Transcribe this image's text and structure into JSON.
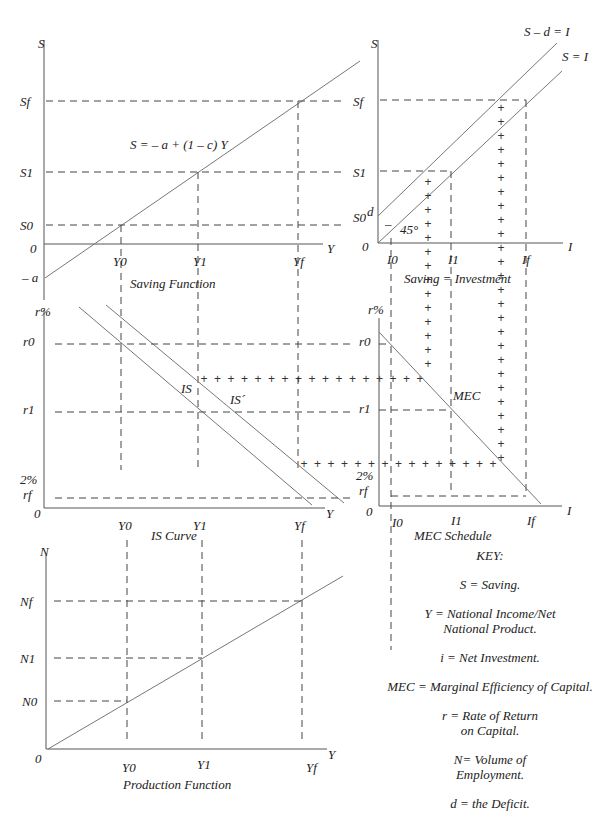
{
  "panels": {
    "saving_function": {
      "caption": "Saving Function",
      "y_axis": "S",
      "x_axis": "Y",
      "origin": "0",
      "y_ticks": [
        "Sf",
        "S1",
        "S0",
        "– a"
      ],
      "x_ticks": [
        "Y0",
        "Y1",
        "Yf"
      ],
      "equation": "S = – a + (1 – c) Y"
    },
    "saving_investment": {
      "caption": "Saving  = Investment",
      "y_axis": "S",
      "x_axis": "I",
      "origin": "0",
      "y_ticks": [
        "Sf",
        "S1",
        "S0",
        "d"
      ],
      "x_ticks": [
        "I0",
        "I1",
        "If"
      ],
      "lines": [
        "S – d = I",
        "S = I"
      ],
      "angle": "45°",
      "minus": "–"
    },
    "is_curve": {
      "caption": "IS Curve",
      "y_axis": "r%",
      "x_axis": "Y",
      "origin": "0",
      "y_ticks": [
        "r0",
        "r1",
        "2%",
        "rf"
      ],
      "x_ticks": [
        "Y0",
        "Y1",
        "Yf"
      ],
      "curves": [
        "IS",
        "IS´"
      ]
    },
    "mec_schedule": {
      "caption": "MEC Schedule",
      "y_axis": "r%",
      "x_axis": "I",
      "origin": "0",
      "y_ticks": [
        "r0",
        "r1",
        "2%",
        "rf"
      ],
      "x_ticks": [
        "I0",
        "I1",
        "If"
      ],
      "curve": "MEC"
    },
    "production_function": {
      "caption": "Production Function",
      "y_axis": "N",
      "x_axis": "Y",
      "origin": "0",
      "y_ticks": [
        "Nf",
        "N1",
        "N0"
      ],
      "x_ticks": [
        "Y0",
        "Y1",
        "Yf"
      ]
    }
  },
  "key": {
    "title": "KEY:",
    "items": [
      "S = Saving.",
      "Y = National Income/Net\nNational Product.",
      "i = Net Investment.",
      "MEC = Marginal Efficiency of Capital.",
      "r = Rate of Return\non  Capital.",
      "N= Volume of\nEmployment.",
      "d = the Deficit."
    ]
  },
  "plus_marker": "+"
}
